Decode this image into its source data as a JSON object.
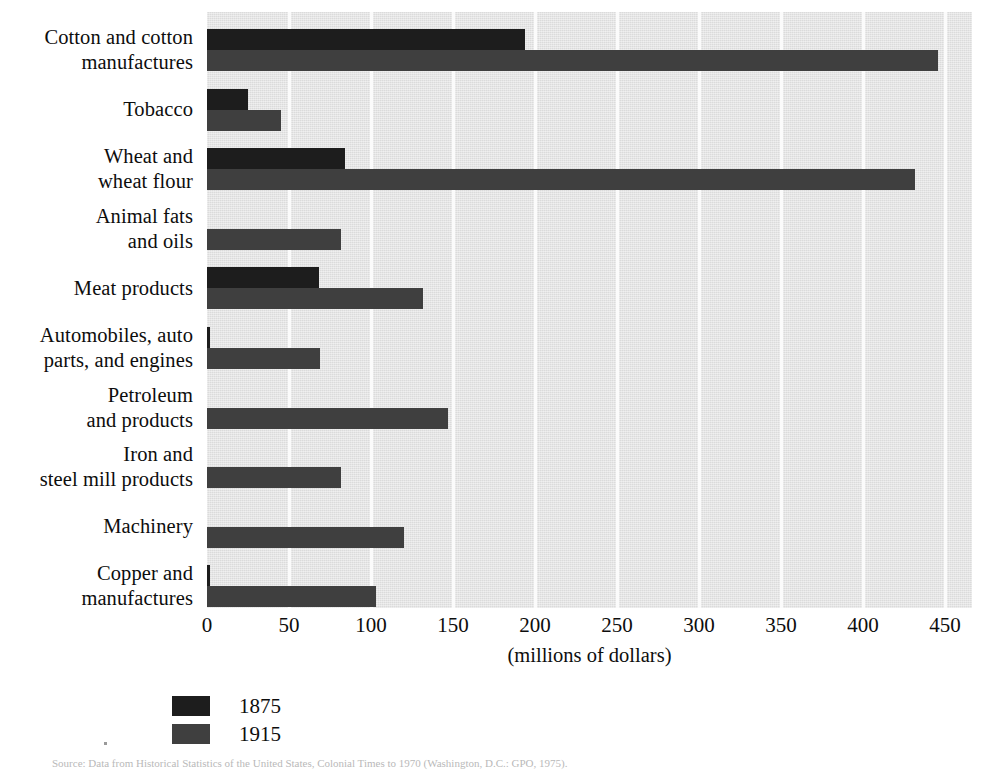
{
  "chart_data": {
    "type": "bar",
    "orientation": "horizontal",
    "title": "",
    "xlabel": "(millions of dollars)",
    "ylabel": "",
    "xlim": [
      0,
      450
    ],
    "xticks": [
      0,
      50,
      100,
      150,
      200,
      250,
      300,
      350,
      400,
      450
    ],
    "xtick_labels": [
      "0",
      "50",
      "100",
      "150",
      "200",
      "250",
      "300",
      "350",
      "400",
      "450"
    ],
    "grid": true,
    "grid_axis": "x",
    "legend_position": "below-left",
    "categories": [
      "Cotton and cotton manufactures",
      "Tobacco",
      "Wheat and wheat flour",
      "Animal fats and oils",
      "Meat products",
      "Automobiles, auto parts, and engines",
      "Petroleum and products",
      "Iron and steel mill products",
      "Machinery",
      "Copper and manufactures"
    ],
    "category_lines": [
      [
        "Cotton and cotton",
        "manufactures"
      ],
      [
        "Tobacco"
      ],
      [
        "Wheat and",
        "wheat flour"
      ],
      [
        "Animal fats",
        "and oils"
      ],
      [
        "Meat products"
      ],
      [
        "Automobiles, auto",
        "parts, and engines"
      ],
      [
        "Petroleum",
        "and products"
      ],
      [
        "Iron and",
        "steel mill products"
      ],
      [
        "Machinery"
      ],
      [
        "Copper and",
        "manufactures"
      ]
    ],
    "series": [
      {
        "name": "1875",
        "color": "#1d1d1d",
        "values": [
          194,
          25,
          84,
          0,
          68,
          2,
          0,
          0,
          0,
          2
        ]
      },
      {
        "name": "1915",
        "color": "#3f3f3f",
        "values": [
          446,
          45,
          432,
          82,
          132,
          69,
          147,
          82,
          120,
          103
        ]
      }
    ]
  },
  "legend": {
    "items": [
      {
        "label": "1875",
        "swatch": "s1875"
      },
      {
        "label": "1915",
        "swatch": "s1915"
      }
    ]
  },
  "footer": {
    "source": "Source: Data from Historical Statistics of the United States, Colonial Times to 1970 (Washington, D.C.: GPO, 1975)."
  }
}
